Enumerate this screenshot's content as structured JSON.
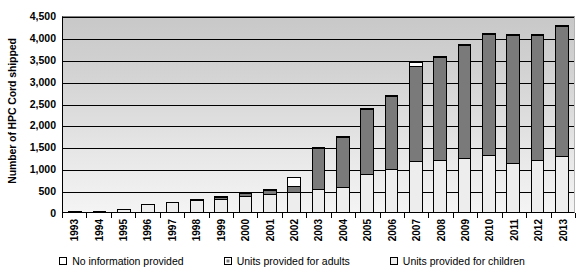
{
  "chart_data": {
    "type": "bar",
    "subtype": "stacked-bar",
    "title": "",
    "xlabel": "",
    "ylabel": "Number of HPC Cord shipped",
    "ylim": [
      0,
      4500
    ],
    "ytick_step": 500,
    "ytick_labels": [
      "0",
      "500",
      "1,000",
      "1,500",
      "2,000",
      "2,500",
      "3,000",
      "3,500",
      "4,000",
      "4,500"
    ],
    "ytick_values": [
      0,
      500,
      1000,
      1500,
      2000,
      2500,
      3000,
      3500,
      4000,
      4500
    ],
    "grid": true,
    "grid_axis": "y",
    "legend_position": "bottom",
    "categories": [
      "1993",
      "1994",
      "1995",
      "1996",
      "1997",
      "1998",
      "1999",
      "2000",
      "2001",
      "2002",
      "2003",
      "2004",
      "2005",
      "2006",
      "2007",
      "2008",
      "2009",
      "2010",
      "2011",
      "2012",
      "2013"
    ],
    "series": [
      {
        "name": "Units provided for children",
        "color": "#ededed",
        "values": [
          10,
          15,
          90,
          200,
          250,
          300,
          330,
          400,
          430,
          480,
          560,
          600,
          880,
          1010,
          1180,
          1210,
          1250,
          1320,
          1150,
          1220,
          1300
        ]
      },
      {
        "name": "Units provided for adults",
        "color": "#7a7a7a",
        "values": [
          0,
          0,
          0,
          0,
          0,
          50,
          70,
          90,
          110,
          160,
          940,
          1170,
          1510,
          1690,
          2210,
          2380,
          2620,
          2790,
          2930,
          2870,
          3000
        ]
      },
      {
        "name": "No information provided",
        "color": "#ffffff",
        "values": [
          0,
          0,
          0,
          0,
          0,
          0,
          30,
          40,
          60,
          220,
          20,
          20,
          20,
          20,
          100,
          20,
          20,
          20,
          20,
          20,
          30
        ]
      }
    ],
    "totals": [
      10,
      15,
      90,
      200,
      250,
      350,
      430,
      530,
      600,
      860,
      1520,
      1790,
      2410,
      2720,
      3490,
      3610,
      3890,
      4130,
      4100,
      4110,
      4330
    ]
  },
  "legend": {
    "items": [
      {
        "label": "No information provided",
        "swatch": "noinfo"
      },
      {
        "label": "Units provided for adults",
        "swatch": "adults"
      },
      {
        "label": "Units provided for children",
        "swatch": "children"
      }
    ]
  }
}
